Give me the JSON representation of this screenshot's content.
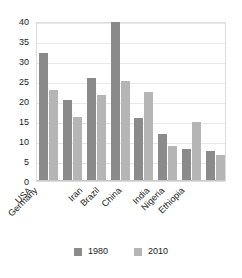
{
  "chart_data": {
    "type": "bar",
    "title": "",
    "subtitle": "",
    "xlabel": "",
    "ylabel": "",
    "ylim": [
      0,
      40
    ],
    "yticks": [
      0,
      5,
      10,
      15,
      20,
      25,
      30,
      35,
      40
    ],
    "ytick_labels": [
      "0",
      "5",
      "10",
      "15",
      "20",
      "25",
      "30",
      "35",
      "40"
    ],
    "grid": true,
    "legend_position": "bottom",
    "categories": [
      "USA",
      "Germany",
      "Iran",
      "Brazil",
      "China",
      "India",
      "Nigeria",
      "Ethiopia"
    ],
    "series": [
      {
        "name": "1980",
        "color": "#8a8a8a",
        "values": [
          32.0,
          20.3,
          25.8,
          39.7,
          15.7,
          11.8,
          8.0,
          7.4
        ]
      },
      {
        "name": "2010",
        "color": "#b5b5b5",
        "values": [
          22.8,
          16.0,
          21.5,
          25.0,
          22.3,
          8.8,
          14.7,
          6.4
        ]
      }
    ]
  },
  "legend": {
    "entries": [
      {
        "label": "1980",
        "color": "#8a8a8a"
      },
      {
        "label": "2010",
        "color": "#b5b5b5"
      }
    ]
  },
  "colors": {
    "series_1980": "#8a8a8a",
    "series_2010": "#b5b5b5",
    "gridline": "#e8e8e8",
    "frame": "#dcdcdc",
    "text": "#1a1a1a",
    "background": "#ffffff"
  }
}
